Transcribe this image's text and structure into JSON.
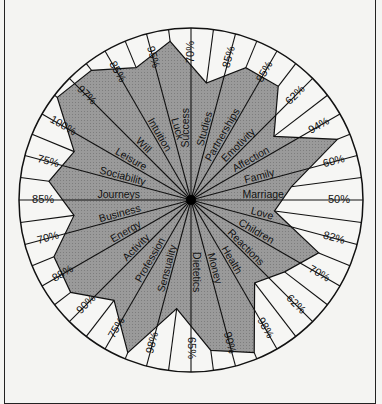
{
  "chart_data": {
    "type": "radar",
    "title": "",
    "center": [
      191,
      200
    ],
    "radius": 172,
    "fill_color": "#9a9a9a",
    "line_color": "#111111",
    "background": "#f4f4f2",
    "categories": [
      "Marriage",
      "Love",
      "Children",
      "Reactions",
      "Health",
      "Money",
      "Dietetics",
      "Sensuality",
      "Profession",
      "Activity",
      "Energy",
      "Business",
      "Journeys",
      "Sociability",
      "Leisure",
      "Will",
      "Intuition",
      "Luck",
      "Success",
      "Studies",
      "Partnerships",
      "Emotivity",
      "Affection",
      "Family"
    ],
    "values": [
      50,
      82,
      70,
      62,
      98,
      90,
      65,
      98,
      75,
      90,
      88,
      70,
      85,
      75,
      100,
      97,
      85,
      95,
      70,
      85,
      85,
      62,
      94,
      60
    ],
    "value_labels": [
      "50%",
      "82%",
      "70%",
      "62%",
      "98%",
      "90%",
      "65%",
      "98%",
      "75%",
      "90%",
      "88%",
      "70%",
      "85%",
      "75%",
      "100%",
      "97%",
      "85%",
      "95%",
      "70%",
      "85%",
      "85%",
      "62%",
      "94%",
      "60%"
    ],
    "units": "%",
    "range": [
      0,
      100
    ]
  }
}
